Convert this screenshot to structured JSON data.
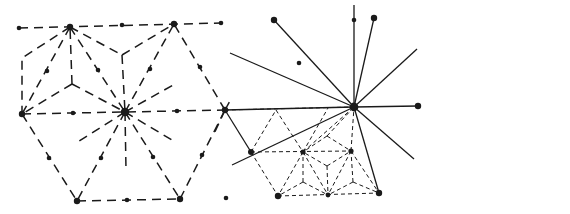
{
  "legend": {
    "items": [
      {
        "label": "Highest level",
        "style": "solid"
      },
      {
        "label": "Medium level",
        "style": "dashed"
      },
      {
        "label": "Lowest level",
        "style": "dotted-dash"
      }
    ]
  },
  "colors": {
    "line": "#1a1a1a",
    "background": "#ffffff"
  }
}
